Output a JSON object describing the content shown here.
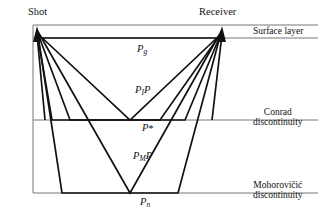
{
  "figure": {
    "endpoints": {
      "shot_label": "Shot",
      "receiver_label": "Receiver"
    },
    "boundaries": [
      {
        "name": "surface-layer",
        "label": "Surface layer",
        "second_line": ""
      },
      {
        "name": "conrad",
        "label": "Conrad",
        "second_line": "discontinuity"
      },
      {
        "name": "moho",
        "label": "Mohorovičić",
        "second_line": "discontinuity"
      }
    ],
    "phases": [
      {
        "name": "pg",
        "main": "P",
        "sub": "g",
        "star": ""
      },
      {
        "name": "pip",
        "main_a": "P",
        "sub": "I",
        "main_b": "P"
      },
      {
        "name": "pstar",
        "main": "P",
        "star": "*"
      },
      {
        "name": "pmp",
        "main_a": "P",
        "sub": "M",
        "main_b": "P"
      },
      {
        "name": "pn",
        "main": "P",
        "sub": "n"
      }
    ],
    "phase_text": {
      "pg_main": "P",
      "pg_sub": "g",
      "pip_main_a": "P",
      "pip_sub": "I",
      "pip_main_b": "P",
      "pstar_main": "P",
      "pstar_star": "*",
      "pmp_main_a": "P",
      "pmp_sub": "M",
      "pmp_main_b": "P",
      "pn_main": "P",
      "pn_sub": "n"
    },
    "colors": {
      "ray_stroke": "#111111",
      "boundary_stroke": "#555555",
      "frame_stroke": "#777777",
      "background": "#ffffff",
      "text": "#111111"
    }
  }
}
